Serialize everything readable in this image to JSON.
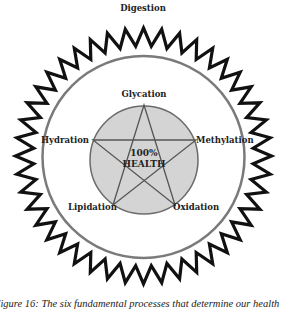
{
  "diagram": {
    "outer_label": "Digestion",
    "center_text": [
      "100%",
      "HEALTH"
    ],
    "points": {
      "top": "Glycation",
      "right": "Methylation",
      "bottom_right": "Oxidation",
      "bottom_left": "Lipidation",
      "left": "Hydration"
    },
    "colors": {
      "zigzag": "#111111",
      "ring": "#7a7a7a",
      "inner_fill": "#d4d4d4",
      "inner_stroke": "#6b6b6b"
    }
  },
  "caption": "Figure 16: The six fundamental processes that determine our health"
}
